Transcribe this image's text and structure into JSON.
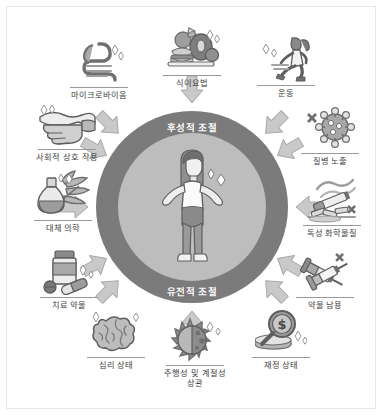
{
  "diagram": {
    "center": {
      "top_label": "후성적 조절",
      "bottom_label": "유전적 조절",
      "figure_icon": "person-standing-icon"
    },
    "colors": {
      "outer_ring": "#7b7b7b",
      "inner_ring": "#bdbdbd",
      "arrow_fill": "#c6c6c6",
      "arrow_stroke": "#8f8f8f",
      "label_text": "#3d3d3d",
      "ring_text": "#ffffff",
      "frame_border": "#e6e6e6",
      "background": "#ffffff",
      "icon_dark": "#6e6e6e",
      "icon_mid": "#9d9d9d",
      "icon_light": "#d2d2d2"
    },
    "factors": [
      {
        "id": "microbiome",
        "label": "마이크로바이옴",
        "icon": "intestines-icon",
        "angle_deg": 135
      },
      {
        "id": "diet",
        "label": "식이요법",
        "icon": "food-plate-icon",
        "angle_deg": 90
      },
      {
        "id": "exercise",
        "label": "운동",
        "icon": "running-person-icon",
        "angle_deg": 45
      },
      {
        "id": "disease",
        "label": "질병 노출",
        "icon": "virus-icon",
        "angle_deg": 20
      },
      {
        "id": "chemicals",
        "label": "독성 화학물질",
        "icon": "cigarette-icon",
        "angle_deg": 0
      },
      {
        "id": "drug-abuse",
        "label": "약물 남용",
        "icon": "syringes-icon",
        "angle_deg": -30
      },
      {
        "id": "financial",
        "label": "재정 상태",
        "icon": "money-magnifier-icon",
        "angle_deg": -60
      },
      {
        "id": "circadian",
        "label": "주행성 및 계절성\n상관",
        "icon": "sun-moon-icon",
        "angle_deg": -90
      },
      {
        "id": "psychological",
        "label": "심리 상태",
        "icon": "brain-icon",
        "angle_deg": -120
      },
      {
        "id": "therapeutic",
        "label": "치료 약물",
        "icon": "pill-bottle-icon",
        "angle_deg": -150
      },
      {
        "id": "altmedicine",
        "label": "대체 의학",
        "icon": "herbal-flask-icon",
        "angle_deg": 180
      },
      {
        "id": "social",
        "label": "사회적 상호 작용",
        "icon": "handshake-icon",
        "angle_deg": 155
      }
    ],
    "arrow_count": 12,
    "arrow_direction": "inward"
  }
}
